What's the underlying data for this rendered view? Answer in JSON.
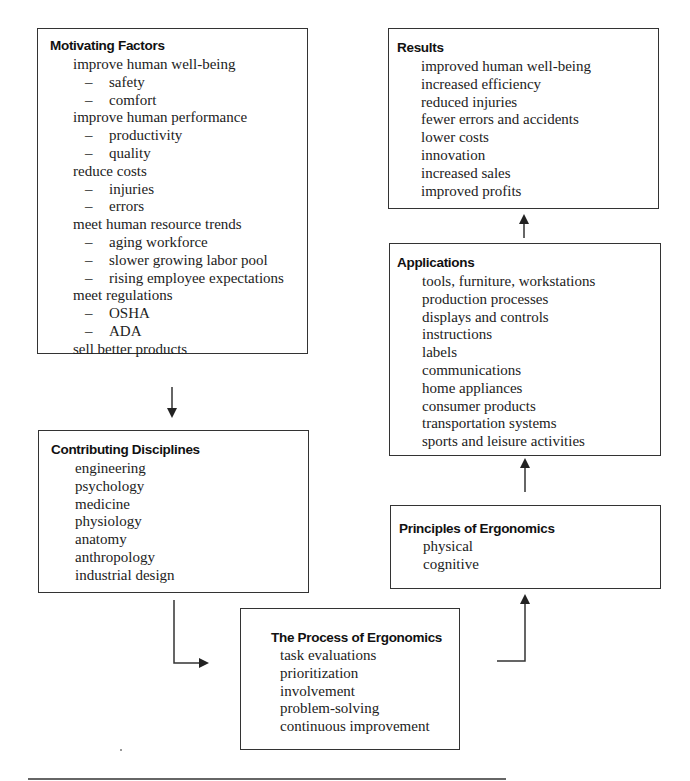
{
  "diagram": {
    "boxes": {
      "motivating_factors": {
        "title": "Motivating Factors",
        "items": [
          {
            "text": "improve human well-being",
            "level": 0
          },
          {
            "text": "safety",
            "level": 1
          },
          {
            "text": "comfort",
            "level": 1
          },
          {
            "text": "improve human performance",
            "level": 0
          },
          {
            "text": "productivity",
            "level": 1
          },
          {
            "text": "quality",
            "level": 1
          },
          {
            "text": "reduce costs",
            "level": 0
          },
          {
            "text": "injuries",
            "level": 1
          },
          {
            "text": "errors",
            "level": 1
          },
          {
            "text": "meet human resource trends",
            "level": 0
          },
          {
            "text": "aging workforce",
            "level": 1
          },
          {
            "text": "slower growing labor pool",
            "level": 1
          },
          {
            "text": "rising employee expectations",
            "level": 1
          },
          {
            "text": "meet regulations",
            "level": 0
          },
          {
            "text": "OSHA",
            "level": 1
          },
          {
            "text": "ADA",
            "level": 1
          },
          {
            "text": "sell better products",
            "level": 0
          }
        ]
      },
      "contributing_disciplines": {
        "title": "Contributing Disciplines",
        "items": [
          "engineering",
          "psychology",
          "medicine",
          "physiology",
          "anatomy",
          "anthropology",
          "industrial design"
        ]
      },
      "process_of_ergonomics": {
        "title": "The Process of Ergonomics",
        "items": [
          "task evaluations",
          "prioritization",
          "involvement",
          "problem-solving",
          "continuous improvement"
        ]
      },
      "principles_of_ergonomics": {
        "title": "Principles of Ergonomics",
        "items": [
          "physical",
          "cognitive"
        ]
      },
      "applications": {
        "title": "Applications",
        "items": [
          "tools, furniture, workstations",
          "production processes",
          "displays and controls",
          "instructions",
          "labels",
          "communications",
          "home appliances",
          "consumer products",
          "transportation systems",
          "sports and leisure activities"
        ]
      },
      "results": {
        "title": "Results",
        "items": [
          "improved human well-being",
          "increased efficiency",
          "reduced injuries",
          "fewer errors and accidents",
          "lower costs",
          "innovation",
          "increased sales",
          "improved profits"
        ]
      }
    },
    "dash_glyph": "–",
    "flow": [
      "Motivating Factors → Contributing Disciplines",
      "Contributing Disciplines → The Process of Ergonomics",
      "The Process of Ergonomics → Principles of Ergonomics",
      "Principles of Ergonomics → Applications",
      "Applications → Results"
    ],
    "colors": {
      "line": "#333333",
      "text": "#222222",
      "background": "#ffffff"
    }
  }
}
